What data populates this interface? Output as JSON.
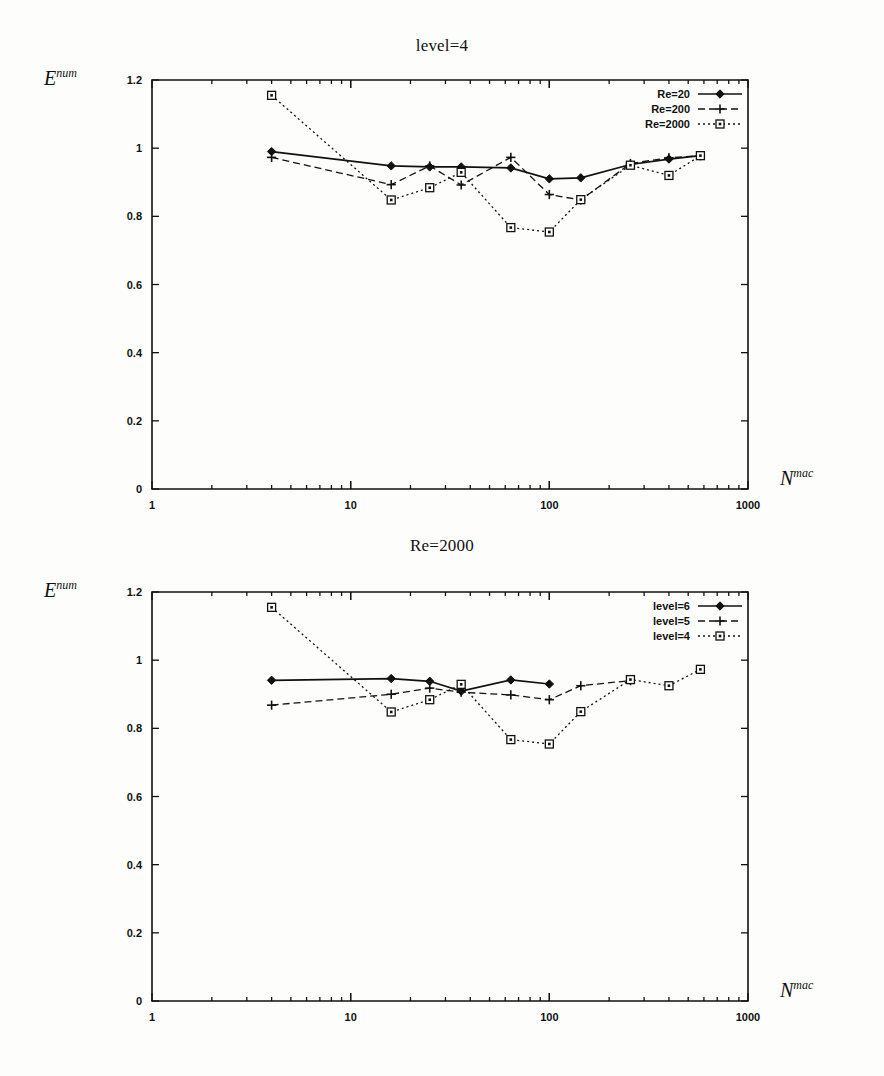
{
  "figures": [
    {
      "id": "figure-top",
      "title": "level=4",
      "ylabel_base": "E",
      "ylabel_sup": "num",
      "xlabel_base": "N",
      "xlabel_sup": "mac",
      "chart_data": {
        "type": "line",
        "title": "level=4",
        "xlabel": "N^mac",
        "ylabel": "E^num",
        "xscale": "log",
        "xlim": [
          1,
          1000
        ],
        "ylim": [
          0,
          1.2
        ],
        "xticks": [
          1,
          10,
          100,
          1000
        ],
        "xtick_labels": [
          "1",
          "10",
          "100",
          "1000"
        ],
        "yticks": [
          0,
          0.2,
          0.4,
          0.6,
          0.8,
          1.0,
          1.2
        ],
        "ytick_labels": [
          "0",
          "0.2",
          "0.4",
          "0.6",
          "0.8",
          "1",
          "1.2"
        ],
        "grid": false,
        "legend_position": "top-right",
        "series": [
          {
            "name": "Re=20",
            "style": "solid",
            "marker": "diamond",
            "x": [
              4,
              16,
              25,
              36,
              64,
              100,
              144,
              256,
              400,
              576
            ],
            "y": [
              0.99,
              0.948,
              0.945,
              0.945,
              0.942,
              0.91,
              0.913,
              0.952,
              0.968,
              0.978
            ]
          },
          {
            "name": "Re=200",
            "style": "dashed",
            "marker": "plus",
            "x": [
              4,
              16,
              25,
              36,
              64,
              100,
              144,
              256,
              400,
              576
            ],
            "y": [
              0.973,
              0.893,
              0.948,
              0.892,
              0.973,
              0.864,
              0.848,
              0.955,
              0.972,
              0.978
            ]
          },
          {
            "name": "Re=2000",
            "style": "dotted",
            "marker": "square",
            "x": [
              4,
              16,
              25,
              36,
              64,
              100,
              144,
              256,
              400,
              576
            ],
            "y": [
              1.155,
              0.848,
              0.884,
              0.929,
              0.767,
              0.754,
              0.849,
              0.95,
              0.92,
              0.978
            ]
          }
        ]
      }
    },
    {
      "id": "figure-bottom",
      "title": "Re=2000",
      "ylabel_base": "E",
      "ylabel_sup": "num",
      "xlabel_base": "N",
      "xlabel_sup": "mac",
      "chart_data": {
        "type": "line",
        "title": "Re=2000",
        "xlabel": "N^mac",
        "ylabel": "E^num",
        "xscale": "log",
        "xlim": [
          1,
          1000
        ],
        "ylim": [
          0,
          1.2
        ],
        "xticks": [
          1,
          10,
          100,
          1000
        ],
        "xtick_labels": [
          "1",
          "10",
          "100",
          "1000"
        ],
        "yticks": [
          0,
          0.2,
          0.4,
          0.6,
          0.8,
          1.0,
          1.2
        ],
        "ytick_labels": [
          "0",
          "0.2",
          "0.4",
          "0.6",
          "0.8",
          "1",
          "1.2"
        ],
        "grid": false,
        "legend_position": "top-right",
        "series": [
          {
            "name": "level=6",
            "style": "solid",
            "marker": "diamond",
            "x": [
              4,
              16,
              25,
              36,
              64,
              100
            ],
            "y": [
              0.941,
              0.946,
              0.938,
              0.909,
              0.942,
              0.93
            ]
          },
          {
            "name": "level=5",
            "style": "dashed",
            "marker": "plus",
            "x": [
              4,
              16,
              25,
              36,
              64,
              100,
              144,
              256
            ],
            "y": [
              0.868,
              0.9,
              0.918,
              0.906,
              0.898,
              0.884,
              0.925,
              0.94
            ]
          },
          {
            "name": "level=4",
            "style": "dotted",
            "marker": "square",
            "x": [
              4,
              16,
              25,
              36,
              64,
              100,
              144,
              256,
              400,
              576
            ],
            "y": [
              1.155,
              0.848,
              0.884,
              0.929,
              0.767,
              0.754,
              0.849,
              0.943,
              0.925,
              0.973
            ]
          }
        ]
      }
    }
  ]
}
